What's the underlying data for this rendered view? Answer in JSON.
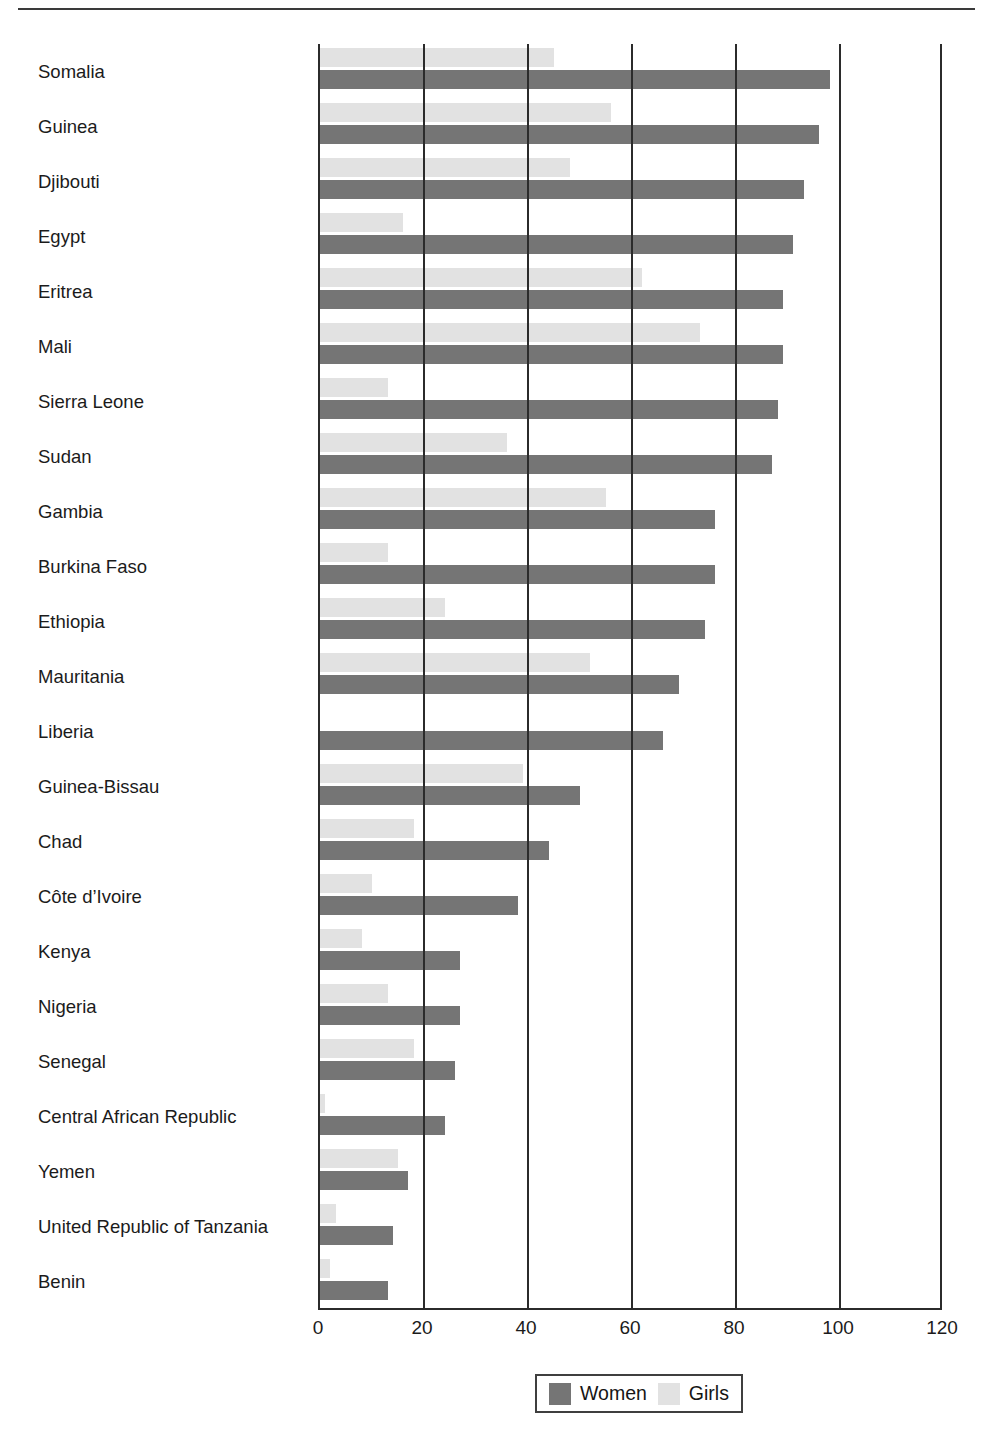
{
  "figure": {
    "has_top_rule": true,
    "background": "#ffffff"
  },
  "legend": {
    "position": "bottom-center",
    "entries": [
      {
        "label": "Women",
        "color": "#757575",
        "swatch": "women-swatch"
      },
      {
        "label": "Girls",
        "color": "#e2e2e2",
        "swatch": "girls-swatch"
      }
    ]
  },
  "chart_data": {
    "type": "bar",
    "orientation": "horizontal",
    "title": "",
    "subtitle": "",
    "xlabel": "",
    "ylabel": "",
    "xlim": [
      0,
      120
    ],
    "ylim": null,
    "xticks": [
      0,
      20,
      40,
      60,
      80,
      100,
      120
    ],
    "xtick_labels": [
      "0",
      "20",
      "40",
      "60",
      "80",
      "100",
      "120"
    ],
    "grid": "vertical",
    "legend_position": "bottom-center",
    "categories": [
      "Somalia",
      "Guinea",
      "Djibouti",
      "Egypt",
      "Eritrea",
      "Mali",
      "Sierra Leone",
      "Sudan",
      "Gambia",
      "Burkina Faso",
      "Ethiopia",
      "Mauritania",
      "Liberia",
      "Guinea-Bissau",
      "Chad",
      "Côte d’Ivoire",
      "Kenya",
      "Nigeria",
      "Senegal",
      "Central African Republic",
      "Yemen",
      "United Republic of Tanzania",
      "Benin"
    ],
    "series": [
      {
        "name": "Girls",
        "color": "#e2e2e2",
        "values": [
          45,
          56,
          48,
          16,
          62,
          73,
          13,
          36,
          55,
          13,
          24,
          52,
          0,
          39,
          18,
          10,
          8,
          13,
          18,
          1,
          15,
          3,
          2
        ]
      },
      {
        "name": "Women",
        "color": "#757575",
        "values": [
          98,
          96,
          93,
          91,
          89,
          89,
          88,
          87,
          76,
          76,
          74,
          69,
          66,
          50,
          44,
          38,
          27,
          27,
          26,
          24,
          17,
          14,
          13
        ]
      }
    ]
  }
}
